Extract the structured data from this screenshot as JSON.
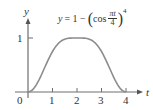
{
  "chart_data": {
    "type": "line",
    "title": "",
    "formula": {
      "lhs": "y",
      "eq": "= 1 −",
      "func": "cos",
      "num": "πt",
      "den": "4",
      "exp": "4",
      "text": "y = 1 − (cos(πt/4))^4"
    },
    "xlabel": "t",
    "ylabel": "y",
    "x_ticks": [
      "0",
      "1",
      "2",
      "3",
      "4"
    ],
    "y_ticks": [
      "1"
    ],
    "xlim": [
      0,
      4.5
    ],
    "ylim": [
      0,
      1.2
    ],
    "grid": false,
    "series": [
      {
        "name": "y = 1 − (cos(πt/4))^4",
        "color": "#8c8c8c",
        "x": [
          0,
          0.25,
          0.5,
          0.75,
          1,
          1.25,
          1.5,
          1.75,
          2,
          2.25,
          2.5,
          2.75,
          3,
          3.25,
          3.5,
          3.75,
          4
        ],
        "values": [
          0,
          0.09,
          0.27,
          0.49,
          0.75,
          0.91,
          0.98,
          1.0,
          1.0,
          1.0,
          0.98,
          0.91,
          0.75,
          0.49,
          0.27,
          0.09,
          0
        ]
      }
    ]
  },
  "axes": {
    "axis_color": "#6e6e6e",
    "text_color": "#333333"
  }
}
